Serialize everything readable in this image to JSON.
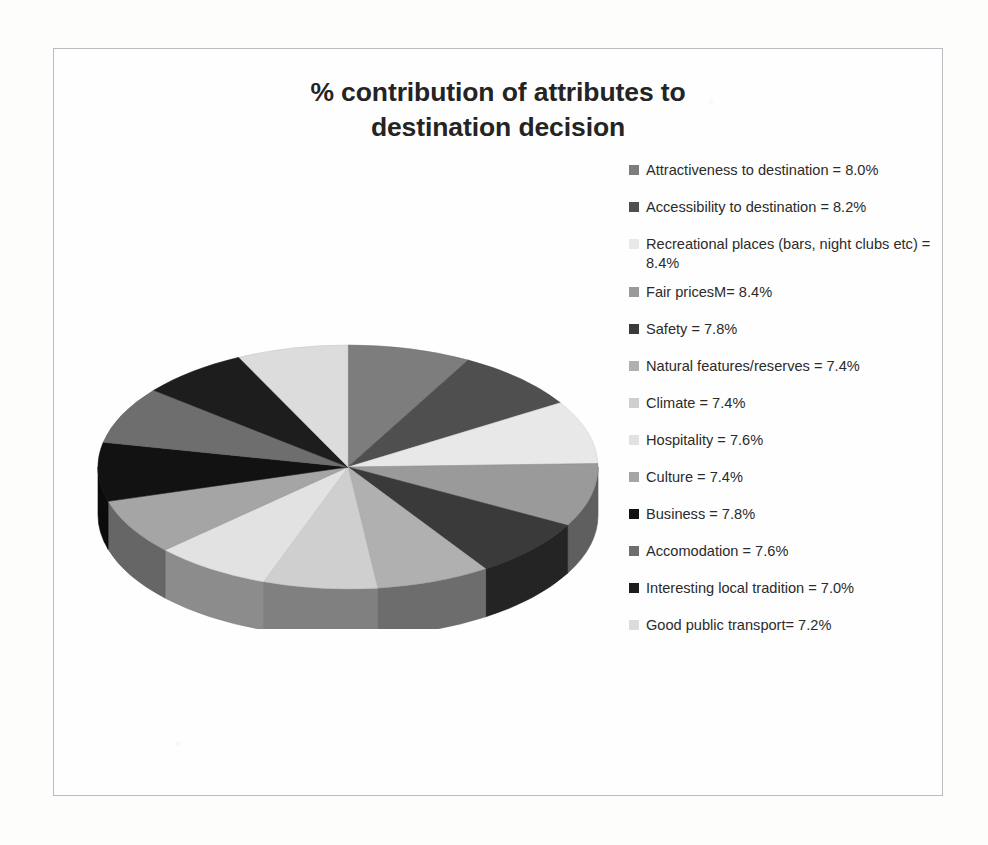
{
  "chart_data": {
    "type": "pie",
    "title": "% contribution of attributes to destination decision",
    "title_lines": [
      "% contribution of attributes to",
      "destination decision"
    ],
    "xlabel": "",
    "ylabel": "",
    "legend_position": "right",
    "grid": false,
    "three_d": true,
    "unit": "%",
    "categories": [
      "Attractiveness to destination",
      "Accessibility to destination",
      "Recreational places (bars, night clubs etc)",
      "Fair pricesM",
      "Safety",
      "Natural features/reserves",
      "Climate",
      "Hospitality",
      "Culture",
      "Business",
      "Accomodation",
      "Interesting local tradition",
      "Good public transport"
    ],
    "values": [
      8.0,
      8.2,
      8.4,
      8.4,
      7.8,
      7.4,
      7.4,
      7.6,
      7.4,
      7.8,
      7.6,
      7.0,
      7.2
    ],
    "colors": [
      "#7d7d7d",
      "#4f4f4f",
      "#e8e8e8",
      "#9a9a9a",
      "#3a3a3a",
      "#b0b0b0",
      "#cfcfcf",
      "#e2e2e2",
      "#a5a5a5",
      "#121212",
      "#6e6e6e",
      "#1d1d1d",
      "#dcdcdc"
    ]
  },
  "legend": {
    "items": [
      {
        "label": "Attractiveness to destination = 8.0%",
        "name": "Attractiveness to destination",
        "value": "8.0%",
        "color": "#7d7d7d"
      },
      {
        "label": "Accessibility to destination =  8.2%",
        "name": "Accessibility to destination",
        "value": "8.2%",
        "color": "#4f4f4f"
      },
      {
        "label": "Recreational places (bars, night clubs etc) = 8.4%",
        "name": "Recreational places (bars, night clubs etc)",
        "value": "8.4%",
        "color": "#e8e8e8"
      },
      {
        "label": "Fair pricesM=  8.4%",
        "name": "Fair pricesM",
        "value": "8.4%",
        "color": "#9a9a9a"
      },
      {
        "label": "Safety = 7.8%",
        "name": "Safety",
        "value": "7.8%",
        "color": "#3a3a3a"
      },
      {
        "label": "Natural features/reserves  = 7.4%",
        "name": "Natural features/reserves",
        "value": "7.4%",
        "color": "#b0b0b0"
      },
      {
        "label": "Climate = 7.4%",
        "name": "Climate",
        "value": "7.4%",
        "color": "#cfcfcf"
      },
      {
        "label": "Hospitality = 7.6%",
        "name": "Hospitality",
        "value": "7.6%",
        "color": "#e2e2e2"
      },
      {
        "label": "Culture = 7.4%",
        "name": "Culture",
        "value": "7.4%",
        "color": "#a5a5a5"
      },
      {
        "label": "Business = 7.8%",
        "name": "Business",
        "value": "7.8%",
        "color": "#121212"
      },
      {
        "label": "Accomodation = 7.6%",
        "name": "Accomodation",
        "value": "7.6%",
        "color": "#6e6e6e"
      },
      {
        "label": "Interesting local tradition = 7.0%",
        "name": "Interesting local tradition",
        "value": "7.0%",
        "color": "#1d1d1d"
      },
      {
        "label": "Good public transport= 7.2%",
        "name": "Good public transport",
        "value": "7.2%",
        "color": "#dcdcdc"
      }
    ]
  },
  "style": {
    "frame_border_color": "#b9bcc0",
    "page_background": "#fdfdfc",
    "plot_background": "#fefefe",
    "title_color": "#242424",
    "legend_text_color": "#2b2b2b"
  }
}
